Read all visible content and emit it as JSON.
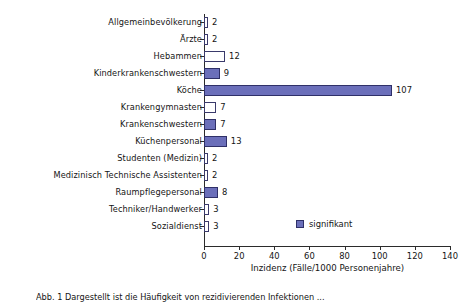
{
  "chart_data": {
    "type": "bar",
    "orientation": "horizontal",
    "title": "",
    "xlabel": "Inzidenz (Fälle/1000 Personenjahre)",
    "ylabel": "",
    "xlim": [
      0,
      140
    ],
    "xticks": [
      0,
      20,
      40,
      60,
      80,
      100,
      120,
      140
    ],
    "grid": false,
    "legend": {
      "position": "inside-lower-right",
      "entries": [
        {
          "label": "signifikant",
          "color": "#6b6fba"
        }
      ]
    },
    "categories": [
      "Allgemeinbevölkerung",
      "Ärzte",
      "Hebammen",
      "Kinderkrankenschwestern",
      "Köche",
      "Krankengymnasten",
      "Krankenschwestern",
      "Küchenpersonal",
      "Studenten (Medizin)",
      "Medizinisch Technische Assistenten",
      "Raumpflegepersonal",
      "Techniker/Handwerker",
      "Sozialdienst"
    ],
    "values": [
      2,
      2,
      12,
      9,
      107,
      7,
      7,
      13,
      2,
      2,
      8,
      3,
      3
    ],
    "significant": [
      false,
      false,
      false,
      true,
      true,
      false,
      true,
      true,
      false,
      false,
      true,
      false,
      false
    ],
    "colors": {
      "significant_fill": "#6b6fba",
      "significant_border": "#2f3068",
      "nonsignificant_fill": "#ffffff",
      "nonsignificant_border": "#3a3a6b",
      "axis": "#2b2b2b",
      "text": "#141414"
    }
  },
  "caption": {
    "text": "Abb. 1   Dargestellt ist die Häufigkeit von rezidivierenden Infektionen ..."
  }
}
